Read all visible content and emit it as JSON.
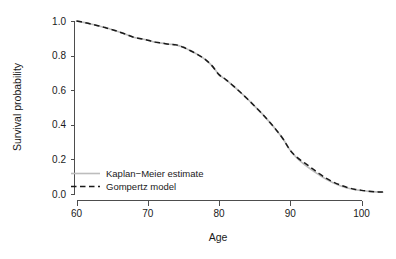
{
  "chart_data": {
    "type": "line",
    "title": "",
    "subtitle": "",
    "xlabel": "Age",
    "ylabel": "Survival probability",
    "xlim": [
      58.2,
      104.5
    ],
    "ylim": [
      -0.035,
      1.035
    ],
    "xticks": [
      60,
      70,
      80,
      90,
      100
    ],
    "xtick_labels": [
      "60",
      "70",
      "80",
      "90",
      "100"
    ],
    "yticks": [
      0.0,
      0.2,
      0.4,
      0.6,
      0.8,
      1.0
    ],
    "ytick_labels": [
      "0.0",
      "0.2",
      "0.4",
      "0.6",
      "0.8",
      "1.0"
    ],
    "grid": false,
    "legend_position": "bottom-left",
    "x": [
      60,
      61,
      62,
      63,
      64,
      65,
      66,
      67,
      68,
      69,
      70,
      71,
      72,
      73,
      74,
      75,
      76,
      77,
      78,
      79,
      80,
      81,
      82,
      83,
      84,
      85,
      86,
      87,
      88,
      89,
      90,
      91,
      92,
      93,
      94,
      95,
      96,
      97,
      98,
      99,
      100,
      101,
      102,
      103
    ],
    "series": [
      {
        "name": "Kaplan-Meier estimate",
        "label": "Kaplan−Meier estimate",
        "color": "#bdbdbd",
        "style": "solid",
        "values": [
          1.0,
          0.992,
          0.983,
          0.973,
          0.962,
          0.95,
          0.937,
          0.922,
          0.906,
          0.898,
          0.889,
          0.878,
          0.872,
          0.866,
          0.862,
          0.848,
          0.828,
          0.806,
          0.78,
          0.742,
          0.69,
          0.66,
          0.625,
          0.588,
          0.549,
          0.508,
          0.466,
          0.42,
          0.372,
          0.318,
          0.252,
          0.205,
          0.17,
          0.14,
          0.112,
          0.086,
          0.065,
          0.048,
          0.035,
          0.026,
          0.02,
          0.015,
          0.012,
          0.01
        ]
      },
      {
        "name": "Gompertz model",
        "label": "Gompertz model",
        "color": "#1a1a1a",
        "style": "dashed",
        "values": [
          1.0,
          0.992,
          0.983,
          0.973,
          0.962,
          0.95,
          0.937,
          0.922,
          0.906,
          0.898,
          0.889,
          0.878,
          0.872,
          0.866,
          0.862,
          0.848,
          0.828,
          0.806,
          0.78,
          0.742,
          0.69,
          0.66,
          0.625,
          0.588,
          0.549,
          0.508,
          0.466,
          0.42,
          0.372,
          0.318,
          0.252,
          0.21,
          0.18,
          0.15,
          0.12,
          0.092,
          0.07,
          0.052,
          0.038,
          0.028,
          0.021,
          0.016,
          0.013,
          0.011
        ]
      }
    ],
    "annotations": []
  },
  "axes": {
    "x_title": "Age",
    "y_title": "Survival probability"
  },
  "legend": {
    "entries": [
      {
        "label": "Kaplan−Meier estimate",
        "color": "#bdbdbd",
        "style": "solid"
      },
      {
        "label": "Gompertz model",
        "color": "#1a1a1a",
        "style": "dashed"
      }
    ]
  },
  "colors": {
    "background": "#ffffff",
    "axis": "#4d4d4d",
    "text": "#1a1a1a",
    "kaplan_meier": "#bdbdbd",
    "gompertz": "#1a1a1a"
  }
}
